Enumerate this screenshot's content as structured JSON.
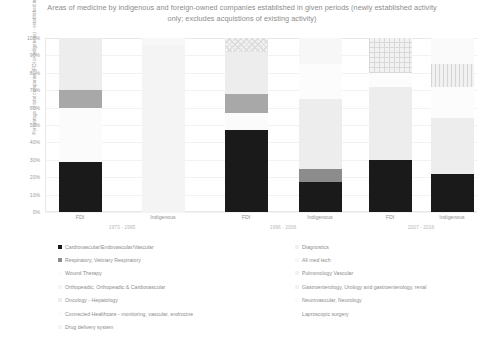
{
  "chart_data": {
    "type": "bar",
    "title": "Areas of medicine by indigenous  and foreign-owned companies established in given periods (newly established activity only; excludes acquistions of existing activity)",
    "subtitle": "",
    "xlabel": "",
    "ylabel": "Percentage of total companies (FDI or indigenous) - established in the given time period",
    "ylim": [
      0,
      100
    ],
    "ytick_labels": [
      "0%",
      "10%",
      "20%",
      "30%",
      "40%",
      "50%",
      "60%",
      "70%",
      "80%",
      "90%",
      "100%"
    ],
    "ytick_values": [
      0,
      10,
      20,
      30,
      40,
      50,
      60,
      70,
      80,
      90,
      100
    ],
    "grid": true,
    "stacked": true,
    "legend_position": "bottom",
    "categories": [
      "FDI",
      "Indigenous",
      "FDI",
      "Indigenous",
      "FDI",
      "Indigenous"
    ],
    "groups": [
      {
        "label": "1973 - 1995",
        "categories": [
          "FDI",
          "Indigenous"
        ]
      },
      {
        "label": "1996 - 2006",
        "categories": [
          "FDI",
          "Indigenous"
        ]
      },
      {
        "label": "2007 - 2016",
        "categories": [
          "FDI",
          "Indigenous"
        ]
      }
    ],
    "series": [
      {
        "name": "Cardiovascular/Endovascular/Vascular",
        "color": "#1a1a1a",
        "pattern": "solid",
        "values": [
          29,
          0,
          47,
          17,
          30,
          22
        ]
      },
      {
        "name": "Respiratory, Vetinary Respiratory",
        "color": "#8c8c8c",
        "pattern": "solid",
        "values": [
          0,
          0,
          0,
          8,
          0,
          0
        ]
      },
      {
        "name": "Wound Therapy",
        "color": "#fbfbfb",
        "pattern": "solid",
        "values": [
          31,
          0,
          10,
          0,
          0,
          0
        ]
      },
      {
        "name": "Orthopeadic, Orthopeadic & Cardiovascular",
        "color": "#a8a8a8",
        "pattern": "solid",
        "values": [
          10,
          0,
          11,
          0,
          0,
          0
        ]
      },
      {
        "name": "Oncology - Hepatology",
        "color": "#ededed",
        "pattern": "solid",
        "values": [
          30,
          0,
          24,
          40,
          42,
          32
        ]
      },
      {
        "name": "Connected Healthcare - monitoring, vascular, endrocine",
        "color": "#fcfcfc",
        "pattern": "solid",
        "values": [
          0,
          0,
          0,
          20,
          8,
          18
        ]
      },
      {
        "name": "Drug delivery system",
        "color": "#f4f4f4",
        "pattern": "solid",
        "values": [
          0,
          96,
          0,
          0,
          0,
          0
        ]
      },
      {
        "name": "Diagnostics",
        "color": "#f0f0f0",
        "pattern": "diagonal-hatch",
        "values": [
          0,
          0,
          8,
          0,
          0,
          0
        ]
      },
      {
        "name": "All med tech",
        "color": "#f7f7f7",
        "pattern": "solid",
        "values": [
          0,
          4,
          0,
          15,
          0,
          0
        ]
      },
      {
        "name": "Pulmonology Vascular",
        "color": "#f2f2f2",
        "pattern": "grid-hatch",
        "values": [
          0,
          0,
          0,
          0,
          20,
          0
        ]
      },
      {
        "name": "Gastroenterology, Urology and gastroenterology, renal",
        "color": "#f1f1f1",
        "pattern": "vertical-stripe",
        "values": [
          0,
          0,
          0,
          0,
          0,
          13
        ]
      },
      {
        "name": "Neurovascular, Neurology",
        "color": "#fafafa",
        "pattern": "solid",
        "values": [
          0,
          0,
          0,
          0,
          0,
          15
        ]
      },
      {
        "name": "Laproscopic surgery",
        "color": "#fdfdfd",
        "pattern": "solid",
        "values": [
          0,
          0,
          0,
          0,
          0,
          0
        ]
      }
    ]
  },
  "legend": {
    "left_column": [
      {
        "label": "Cardiovascular/Endovascular/Vascular",
        "color": "#1a1a1a"
      },
      {
        "label": "Respiratory, Vetinary Respiratory",
        "color": "#8c8c8c"
      },
      {
        "label": "Wound Therapy",
        "color": "#fbfbfb"
      },
      {
        "label": "Orthopeadic, Orthopeadic & Cardiovascular",
        "color": "#f6f6f6"
      },
      {
        "label": "Oncology - Hepatology",
        "color": "#ededed"
      },
      {
        "label": "Connected Healthcare - monitoring, vascular, endrocine",
        "color": "#fcfcfc"
      },
      {
        "label": "Drug delivery system",
        "color": "#f4f4f4"
      }
    ],
    "right_column": [
      {
        "label": "Diagnostics",
        "color": "#f0f0f0"
      },
      {
        "label": "All med tech",
        "color": "#f7f7f7"
      },
      {
        "label": "Pulmonology Vascular",
        "color": "#f2f2f2"
      },
      {
        "label": "Gastroenterology, Urology and gastroenterology, renal",
        "color": "#f1f1f1"
      },
      {
        "label": "Neurovascular, Neurology",
        "color": "#fafafa"
      },
      {
        "label": "Laproscopic surgery",
        "color": "#fdfdfd"
      }
    ]
  }
}
